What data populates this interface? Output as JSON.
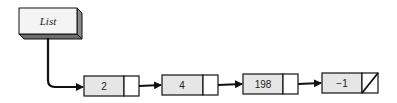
{
  "diagram": {
    "type": "linked-list",
    "head": {
      "label": "List"
    },
    "nodes": [
      {
        "value": "2",
        "next": "node"
      },
      {
        "value": "4",
        "next": "node"
      },
      {
        "value": "198",
        "next": "node"
      },
      {
        "value": "−1",
        "next": "null"
      }
    ],
    "colors": {
      "node_fill": "#e6e6e6",
      "stroke": "#111111",
      "head_top": "#f4f4f4",
      "head_side": "#8a8a8a",
      "head_bottom": "#6e6e6e"
    }
  }
}
